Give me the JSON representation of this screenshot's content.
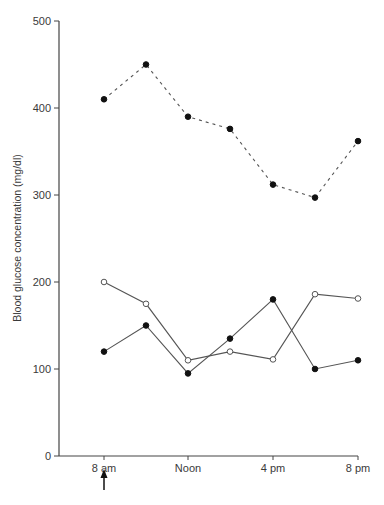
{
  "chart_data": {
    "type": "line",
    "title": "",
    "xlabel": "",
    "ylabel": "Blood glucose concentration (mg/dl)",
    "ylim": [
      0,
      500
    ],
    "yticks": [
      0,
      100,
      200,
      300,
      400,
      500
    ],
    "xtick_labels": [
      "8 am",
      "Noon",
      "4 pm",
      "8 pm"
    ],
    "x": [
      "8 am",
      "10 am",
      "Noon",
      "2 pm",
      "4 pm",
      "6 pm",
      "8 pm"
    ],
    "grid": false,
    "legend": null,
    "annotations": [
      {
        "type": "arrow-up",
        "at": "8 am",
        "position": "below x-axis"
      }
    ],
    "series": [
      {
        "name": "filled-dashed",
        "marker": "filled-circle",
        "line": "dashed",
        "values": [
          410,
          450,
          390,
          376,
          312,
          297,
          362
        ]
      },
      {
        "name": "open-solid",
        "marker": "open-circle",
        "line": "solid",
        "values": [
          200,
          175,
          110,
          120,
          111,
          186,
          181
        ]
      },
      {
        "name": "filled-solid",
        "marker": "filled-circle",
        "line": "solid",
        "values": [
          120,
          150,
          95,
          135,
          180,
          100,
          110
        ]
      }
    ]
  },
  "colors": {
    "line": "#555555",
    "marker": "#111111",
    "axis": "#444444",
    "text": "#3a3a3a"
  }
}
